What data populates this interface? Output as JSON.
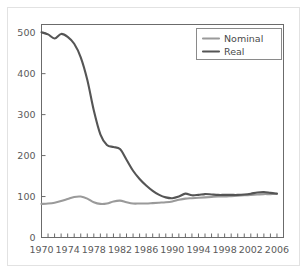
{
  "figure": {
    "frame_color": "#e2e2e2",
    "background": "#ffffff",
    "axis_color": "#6b6b6b",
    "legend_border_color": "#8a8a8a"
  },
  "legend": {
    "position": "top-right",
    "entries": [
      {
        "label": "Nominal",
        "color": "#9a9a9a"
      },
      {
        "label": "Real",
        "color": "#555555"
      }
    ]
  },
  "axis": {
    "y_tick_labels": [
      "0",
      "100",
      "200",
      "300",
      "400",
      "500"
    ],
    "x_tick_labels": [
      "1970",
      "1974",
      "1978",
      "1982",
      "1986",
      "1990",
      "1994",
      "1998",
      "2002",
      "2006"
    ]
  },
  "chart_data": {
    "type": "line",
    "title": "",
    "subtitle": "",
    "xlabel": "",
    "ylabel": "",
    "xlim": [
      1970,
      2007
    ],
    "ylim": [
      0,
      520
    ],
    "grid": false,
    "legend_position": "top-right",
    "y_ticks": [
      0,
      100,
      200,
      300,
      400,
      500
    ],
    "x_ticks": [
      1970,
      1974,
      1978,
      1982,
      1986,
      1990,
      1994,
      1998,
      2002,
      2006
    ],
    "x_minor_tick_step": 1,
    "x": [
      1970,
      1971,
      1972,
      1973,
      1974,
      1975,
      1976,
      1977,
      1978,
      1979,
      1980,
      1981,
      1982,
      1983,
      1984,
      1985,
      1986,
      1987,
      1988,
      1989,
      1990,
      1991,
      1992,
      1993,
      1994,
      1995,
      1996,
      1997,
      1998,
      1999,
      2000,
      2001,
      2002,
      2003,
      2004,
      2005,
      2006
    ],
    "series": [
      {
        "name": "Nominal",
        "color": "#9a9a9a",
        "values": [
          82,
          83,
          85,
          89,
          94,
          99,
          100,
          95,
          86,
          82,
          83,
          88,
          90,
          86,
          83,
          83,
          83,
          84,
          85,
          86,
          88,
          92,
          95,
          96,
          97,
          98,
          99,
          100,
          100,
          101,
          102,
          103,
          104,
          105,
          106,
          106,
          107
        ]
      },
      {
        "name": "Real",
        "color": "#555555",
        "values": [
          501,
          496,
          486,
          497,
          490,
          473,
          440,
          385,
          310,
          252,
          226,
          221,
          216,
          190,
          163,
          143,
          127,
          114,
          104,
          98,
          96,
          100,
          107,
          103,
          104,
          106,
          105,
          104,
          104,
          104,
          104,
          105,
          107,
          110,
          111,
          109,
          107
        ]
      }
    ]
  }
}
